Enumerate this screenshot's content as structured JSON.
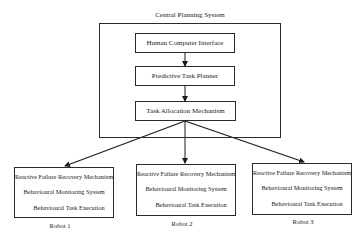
{
  "diagram": {
    "central": {
      "title": "Central Planning System",
      "modules": [
        {
          "label": "Human Computer Interface"
        },
        {
          "label": "Predictive Task Planner"
        },
        {
          "label": "Task Allocation Mechanism"
        }
      ]
    },
    "robots": [
      {
        "name": "Robot 1",
        "modules": [
          "Reactive Failure Recovery Mechanism",
          "Behavioural Monitoring System",
          "Behavioural Task Execution"
        ]
      },
      {
        "name": "Robot 2",
        "modules": [
          "Reactive Failure Recovery Mechanism",
          "Behavioural Monitoring System",
          "Behavioural Task Execution"
        ]
      },
      {
        "name": "Robot 3",
        "modules": [
          "Reactive Failure Recovery Mechanism",
          "Behavioural Monitoring System",
          "Behavioural Task Execution"
        ]
      }
    ],
    "edges": [
      {
        "from": "Human Computer Interface",
        "to": "Predictive Task Planner"
      },
      {
        "from": "Predictive Task Planner",
        "to": "Task Allocation Mechanism"
      },
      {
        "from": "Task Allocation Mechanism",
        "to": "Robot 1"
      },
      {
        "from": "Task Allocation Mechanism",
        "to": "Robot 2"
      },
      {
        "from": "Task Allocation Mechanism",
        "to": "Robot 3"
      }
    ],
    "colors": {
      "line": "#2a2a2a",
      "background": "#ffffff"
    }
  }
}
